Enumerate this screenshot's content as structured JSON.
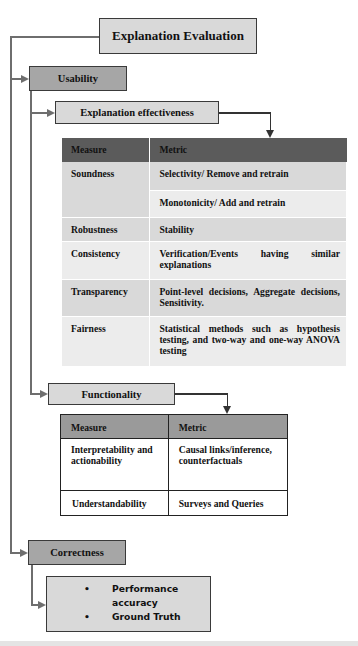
{
  "diagram": {
    "root": {
      "label": "Explanation Evaluation",
      "color": "#d9d9d9"
    },
    "usability": {
      "label": "Usability",
      "color": "#a6a6a6",
      "explanation_effectiveness": {
        "label": "Explanation effectiveness",
        "color": "#d9d9d9",
        "table": {
          "headers": [
            "Measure",
            "Metric"
          ],
          "header_color": "#5b5b5b",
          "rows": [
            {
              "measure": "Soundness",
              "metrics": [
                "Selectivity/ Remove and retrain",
                "Monotonicity/ Add and retrain"
              ]
            },
            {
              "measure": "Robustness",
              "metrics": [
                "Stability"
              ]
            },
            {
              "measure": "Consistency",
              "metrics": [
                "Verification/Events having similar explanations"
              ]
            },
            {
              "measure": "Transparency",
              "metrics": [
                "Point-level decisions, Aggregate decisions, Sensitivity."
              ]
            },
            {
              "measure": "Fairness",
              "metrics": [
                "Statistical methods such as hypothesis testing, and two-way and one-way ANOVA testing"
              ]
            }
          ]
        }
      },
      "functionality": {
        "label": "Functionality",
        "color": "#d9d9d9",
        "table": {
          "headers": [
            "Measure",
            "Metric"
          ],
          "header_color": "#9a9a9a",
          "rows": [
            {
              "measure": "Interpretability and actionability",
              "metric": "Causal links/inference, counterfactuals"
            },
            {
              "measure": "Understandability",
              "metric": "Surveys and Queries"
            }
          ]
        }
      }
    },
    "correctness": {
      "label": "Correctness",
      "color": "#a6a6a6",
      "details": {
        "color": "#d9d9d9",
        "bullet_glyph": "•",
        "items": [
          "Performance accuracy",
          "Ground Truth"
        ]
      }
    }
  }
}
